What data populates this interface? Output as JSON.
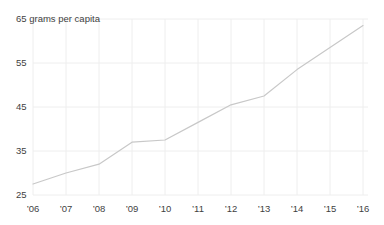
{
  "page": {
    "background_color": "#ffffff"
  },
  "chart_data": {
    "type": "line",
    "title": "65 grams per capita",
    "unit_label": "grams per capita",
    "categories": [
      "’06",
      "’07",
      "’08",
      "’09",
      "’10",
      "’11",
      "’12",
      "’13",
      "’14",
      "’15",
      "’16"
    ],
    "series": [
      {
        "name": "grams per capita",
        "values": [
          27.5,
          30,
          32,
          37,
          37.5,
          41.5,
          45.5,
          47.5,
          53.5,
          58.5,
          63.5
        ]
      }
    ],
    "xlabel": "",
    "ylabel": "",
    "ylim": [
      25,
      65
    ],
    "yticks": [
      25,
      35,
      45,
      55,
      65
    ],
    "ytick_labels": [
      "25",
      "35",
      "45",
      "55",
      "65 grams per capita"
    ],
    "grid": true,
    "legend": "none",
    "colors": {
      "line": "#c8c8c8",
      "grid": "#eeeeee",
      "text": "#3f3f3f",
      "background": "#ffffff"
    }
  }
}
